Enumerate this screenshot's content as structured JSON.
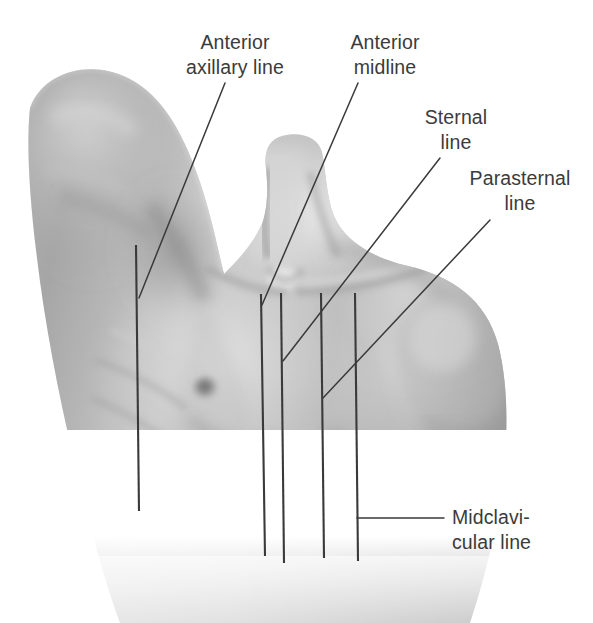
{
  "figure": {
    "background_color": "#ffffff",
    "label_color": "#3b3b3b",
    "line_color": "#3a3a3a",
    "width": 593,
    "height": 623
  },
  "labels": [
    {
      "id": "anterior-axillary-line",
      "text_line1": "Anterior",
      "text_line2": "axillary line",
      "align": "center",
      "x": 165,
      "y": 30,
      "width": 140
    },
    {
      "id": "anterior-midline",
      "text_line1": "Anterior",
      "text_line2": "midline",
      "align": "center",
      "x": 325,
      "y": 30,
      "width": 120
    },
    {
      "id": "sternal-line",
      "text_line1": "Sternal",
      "text_line2": "line",
      "align": "center",
      "x": 406,
      "y": 105,
      "width": 100
    },
    {
      "id": "parasternal-line",
      "text_line1": "Parasternal",
      "text_line2": "line",
      "align": "center",
      "x": 455,
      "y": 166,
      "width": 130
    },
    {
      "id": "midclavicular-line",
      "text_line1": "Midclavi-",
      "text_line2": "cular line",
      "align": "left",
      "x": 452,
      "y": 505,
      "width": 140
    }
  ],
  "reference_lines": [
    {
      "id": "anterior-axillary-line",
      "type": "vertical-body-line",
      "x1": 136,
      "y1": 245,
      "x2": 139,
      "y2": 511
    },
    {
      "id": "anterior-midline",
      "type": "vertical-body-line",
      "x1": 261,
      "y1": 294,
      "x2": 265,
      "y2": 556
    },
    {
      "id": "sternal-line",
      "type": "vertical-body-line",
      "x1": 281,
      "y1": 293,
      "x2": 284,
      "y2": 563
    },
    {
      "id": "parasternal-line",
      "type": "vertical-body-line",
      "x1": 321,
      "y1": 293,
      "x2": 324,
      "y2": 558
    },
    {
      "id": "midclavicular-line",
      "type": "vertical-body-line",
      "x1": 355,
      "y1": 293,
      "x2": 358,
      "y2": 561
    }
  ],
  "leader_lines": [
    {
      "id": "leader-anterior-axillary-line",
      "x1": 225,
      "y1": 83,
      "x2": 139,
      "y2": 298
    },
    {
      "id": "leader-anterior-midline",
      "x1": 358,
      "y1": 83,
      "x2": 262,
      "y2": 305
    },
    {
      "id": "leader-sternal-line",
      "x1": 440,
      "y1": 158,
      "x2": 283,
      "y2": 361
    },
    {
      "id": "leader-parasternal-line",
      "x1": 490,
      "y1": 220,
      "x2": 323,
      "y2": 398
    },
    {
      "id": "leader-midclavicular-line",
      "x1": 357,
      "y1": 518,
      "x2": 444,
      "y2": 518
    }
  ]
}
